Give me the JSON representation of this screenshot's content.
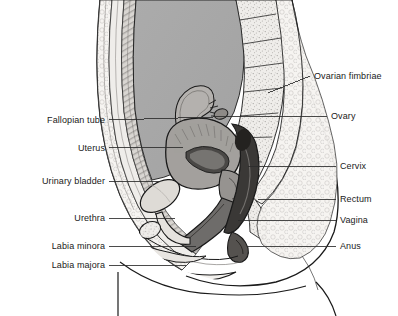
{
  "figure": {
    "width": 398,
    "height": 316,
    "background_color": "#ffffff",
    "line_color": "#1a1a1a",
    "label_font_size_px": 9
  },
  "palette": {
    "outline": "#1a1a1a",
    "abdominal_cavity_gray": "#a8a8a8",
    "skin_light": "#f3f1ee",
    "bone_stipple": "#e9e7e4",
    "muscle_mid_gray": "#8f8d8b",
    "uterus_gray": "#a3a09d",
    "endometrium_dark": "#4a4846",
    "rectum_dark": "#3a3836",
    "bladder_light": "#dedbd6",
    "vagina_gray": "#6e6c6a",
    "leader_line": "#2b2b2b"
  },
  "labels": {
    "left": [
      {
        "id": "fallopian-tube",
        "text": "Fallopian tube",
        "text_right_px": 105,
        "y_px": 120,
        "leader_end_x_px": 213,
        "leader_end_y_px": 117
      },
      {
        "id": "uterus",
        "text": "Uterus",
        "text_right_px": 105,
        "y_px": 148,
        "leader_end_x_px": 183,
        "leader_end_y_px": 147
      },
      {
        "id": "urinary-bladder",
        "text": "Urinary bladder",
        "text_right_px": 105,
        "y_px": 181,
        "leader_end_x_px": 160,
        "leader_end_y_px": 181
      },
      {
        "id": "urethra",
        "text": "Urethra",
        "text_right_px": 105,
        "y_px": 218,
        "leader_end_x_px": 175,
        "leader_end_y_px": 218
      },
      {
        "id": "labia-minora",
        "text": "Labia minora",
        "text_right_px": 105,
        "y_px": 246,
        "leader_end_x_px": 196,
        "leader_end_y_px": 246
      },
      {
        "id": "labia-majora",
        "text": "Labia majora",
        "text_right_px": 105,
        "y_px": 265,
        "leader_end_x_px": 186,
        "leader_end_y_px": 265
      }
    ],
    "right": [
      {
        "id": "ovarian-fimbriae",
        "text": "Ovarian fimbriae",
        "text_left_px": 314,
        "y_px": 76,
        "leader_end_x_px": 268,
        "leader_end_y_px": 93
      },
      {
        "id": "ovary",
        "text": "Ovary",
        "text_left_px": 331,
        "y_px": 116,
        "leader_end_x_px": 213,
        "leader_end_y_px": 117
      },
      {
        "id": "cervix",
        "text": "Cervix",
        "text_left_px": 340,
        "y_px": 166,
        "leader_end_x_px": 248,
        "leader_end_y_px": 166
      },
      {
        "id": "rectum",
        "text": "Rectum",
        "text_left_px": 340,
        "y_px": 199,
        "leader_end_x_px": 258,
        "leader_end_y_px": 199
      },
      {
        "id": "vagina",
        "text": "Vagina",
        "text_left_px": 340,
        "y_px": 220,
        "leader_end_x_px": 238,
        "leader_end_y_px": 220
      },
      {
        "id": "anus",
        "text": "Anus",
        "text_left_px": 340,
        "y_px": 246,
        "leader_end_x_px": 247,
        "leader_end_y_px": 246
      }
    ]
  }
}
